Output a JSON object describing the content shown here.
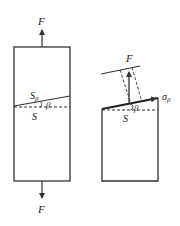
{
  "diagram": {
    "colors": {
      "stroke": "#333333",
      "text": "#222222",
      "background": "#ffffff"
    },
    "left_figure": {
      "force_top_label": "F",
      "force_bottom_label": "F",
      "inclined_section_label": "S",
      "inclined_section_subscript": "β",
      "cross_section_label": "S",
      "angle_label": "β"
    },
    "right_figure": {
      "force_label": "F",
      "stress_label": "σ",
      "stress_subscript": "β",
      "cross_section_label": "S",
      "angle_label": "β"
    }
  }
}
